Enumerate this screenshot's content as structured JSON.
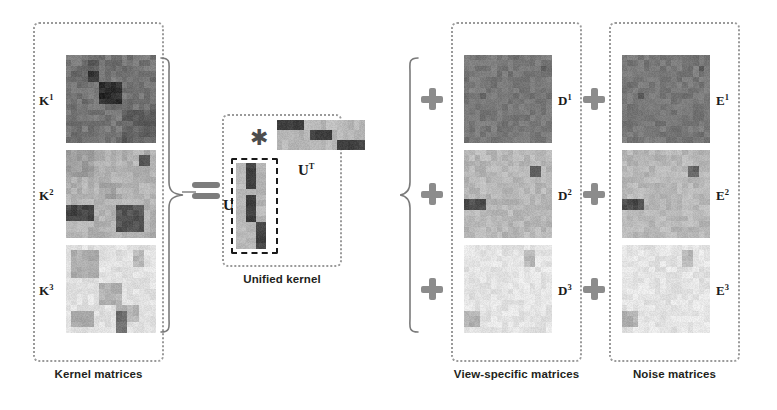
{
  "figure": {
    "background": "#ffffff"
  },
  "groups": [
    {
      "id": "kernel",
      "caption": "Kernel matrices",
      "x": 33,
      "y": 22,
      "w": 131,
      "h": 340
    },
    {
      "id": "unified",
      "caption": "Unified kernel",
      "x": 222,
      "y": 114,
      "w": 120,
      "h": 153
    },
    {
      "id": "view_specific",
      "caption": "View-specific matrices",
      "x": 451,
      "y": 22,
      "w": 131,
      "h": 340
    },
    {
      "id": "noise",
      "caption": "Noise matrices",
      "x": 609,
      "y": 22,
      "w": 131,
      "h": 340
    }
  ],
  "labels": {
    "k1": "K",
    "k1_sup": "1",
    "k2": "K",
    "k2_sup": "2",
    "k3": "K",
    "k3_sup": "3",
    "u": "U",
    "ut": "U",
    "ut_sup": "T",
    "d1": "D",
    "d1_sup": "1",
    "d2": "D",
    "d2_sup": "2",
    "d3": "D",
    "d3_sup": "3",
    "e1": "E",
    "e1_sup": "1",
    "e2": "E",
    "e2_sup": "2",
    "e3": "E",
    "e3_sup": "3",
    "asterisk": "✳",
    "equals_name": "equals-sign",
    "plus_name": "plus-sign"
  },
  "colors": {
    "box_border": "#9a9a9a",
    "operator": "#8c8c8c",
    "text": "#231f20",
    "brace": "#7a7a7a",
    "matrix_dark": "#3c3c3c",
    "matrix_mid": "#8f8f8f",
    "matrix_light": "#dcdcdc"
  },
  "chart_data": {
    "type": "heatmap",
    "note": "Each panel is a grayscale heatmap rendered on a 16x16 grid (U/U^T are 16x3 / 3x16).",
    "scale": {
      "min": 0,
      "max": 1,
      "colormap": "grayscale (0=dark, 1=light)"
    },
    "matrices": [
      {
        "name": "K1",
        "label": "K",
        "superscript": "1",
        "group": "kernel",
        "rows": 16,
        "cols": 16,
        "base": 0.46,
        "noise": 0.06,
        "blocks": [
          {
            "r": 0,
            "c": 0,
            "rh": 16,
            "cw": 16,
            "v": 0.46
          },
          {
            "r": 1,
            "c": 4,
            "rh": 2,
            "cw": 2,
            "v": 0.39
          },
          {
            "r": 2,
            "c": 2,
            "rh": 2,
            "cw": 2,
            "v": 0.41
          },
          {
            "r": 3,
            "c": 1,
            "rh": 2,
            "cw": 1,
            "v": 0.36
          },
          {
            "r": 3,
            "c": 4,
            "rh": 2,
            "cw": 2,
            "v": 0.22
          },
          {
            "r": 3,
            "c": 13,
            "rh": 1,
            "cw": 2,
            "v": 0.38
          },
          {
            "r": 5,
            "c": 6,
            "rh": 4,
            "cw": 4,
            "v": 0.17
          },
          {
            "r": 8,
            "c": 3,
            "rh": 1,
            "cw": 2,
            "v": 0.38
          },
          {
            "r": 10,
            "c": 10,
            "rh": 6,
            "cw": 6,
            "v": 0.38
          }
        ]
      },
      {
        "name": "K2",
        "label": "K",
        "superscript": "2",
        "group": "kernel",
        "rows": 16,
        "cols": 16,
        "base": 0.68,
        "noise": 0.05,
        "blocks": [
          {
            "r": 0,
            "c": 0,
            "rh": 16,
            "cw": 16,
            "v": 0.7
          },
          {
            "r": 0,
            "c": 0,
            "rh": 5,
            "cw": 5,
            "v": 0.62
          },
          {
            "r": 1,
            "c": 13,
            "rh": 2,
            "cw": 2,
            "v": 0.33
          },
          {
            "r": 6,
            "c": 6,
            "rh": 3,
            "cw": 3,
            "v": 0.64
          },
          {
            "r": 10,
            "c": 0,
            "rh": 3,
            "cw": 5,
            "v": 0.27
          },
          {
            "r": 10,
            "c": 9,
            "rh": 5,
            "cw": 5,
            "v": 0.33
          }
        ]
      },
      {
        "name": "K3",
        "label": "K",
        "superscript": "3",
        "group": "kernel",
        "rows": 16,
        "cols": 16,
        "base": 0.87,
        "noise": 0.04,
        "blocks": [
          {
            "r": 0,
            "c": 0,
            "rh": 16,
            "cw": 16,
            "v": 0.88
          },
          {
            "r": 1,
            "c": 1,
            "rh": 5,
            "cw": 5,
            "v": 0.68
          },
          {
            "r": 1,
            "c": 12,
            "rh": 3,
            "cw": 2,
            "v": 0.72
          },
          {
            "r": 7,
            "c": 6,
            "rh": 4,
            "cw": 4,
            "v": 0.7
          },
          {
            "r": 11,
            "c": 9,
            "rh": 3,
            "cw": 4,
            "v": 0.7
          },
          {
            "r": 12,
            "c": 1,
            "rh": 3,
            "cw": 4,
            "v": 0.66
          },
          {
            "r": 12,
            "c": 9,
            "rh": 4,
            "cw": 2,
            "v": 0.43
          }
        ]
      },
      {
        "name": "U",
        "label": "U",
        "superscript": "",
        "group": "unified",
        "rows": 16,
        "cols": 3,
        "base": 0.7,
        "noise": 0.04,
        "blocks": [
          {
            "r": 0,
            "c": 0,
            "rh": 16,
            "cw": 3,
            "v": 0.72
          },
          {
            "r": 0,
            "c": 1,
            "rh": 5,
            "cw": 1,
            "v": 0.26
          },
          {
            "r": 6,
            "c": 1,
            "rh": 5,
            "cw": 1,
            "v": 0.26
          },
          {
            "r": 11,
            "c": 2,
            "rh": 5,
            "cw": 1,
            "v": 0.26
          }
        ]
      },
      {
        "name": "UT",
        "label": "U",
        "superscript": "T",
        "group": "unified",
        "rows": 3,
        "cols": 16,
        "base": 0.7,
        "noise": 0.04,
        "blocks": [
          {
            "r": 0,
            "c": 0,
            "rh": 3,
            "cw": 16,
            "v": 0.72
          },
          {
            "r": 0,
            "c": 0,
            "rh": 1,
            "cw": 5,
            "v": 0.26
          },
          {
            "r": 1,
            "c": 6,
            "rh": 1,
            "cw": 4,
            "v": 0.26
          },
          {
            "r": 2,
            "c": 11,
            "rh": 1,
            "cw": 5,
            "v": 0.26
          }
        ]
      },
      {
        "name": "D1",
        "label": "D",
        "superscript": "1",
        "group": "view_specific",
        "rows": 16,
        "cols": 16,
        "base": 0.47,
        "noise": 0.05,
        "blocks": [
          {
            "r": 0,
            "c": 0,
            "rh": 16,
            "cw": 16,
            "v": 0.47
          },
          {
            "r": 2,
            "c": 14,
            "rh": 1,
            "cw": 1,
            "v": 0.36
          },
          {
            "r": 7,
            "c": 3,
            "rh": 1,
            "cw": 1,
            "v": 0.37
          }
        ]
      },
      {
        "name": "D2",
        "label": "D",
        "superscript": "2",
        "group": "view_specific",
        "rows": 16,
        "cols": 16,
        "base": 0.71,
        "noise": 0.05,
        "blocks": [
          {
            "r": 0,
            "c": 0,
            "rh": 16,
            "cw": 16,
            "v": 0.72
          },
          {
            "r": 3,
            "c": 12,
            "rh": 2,
            "cw": 2,
            "v": 0.41
          },
          {
            "r": 9,
            "c": 0,
            "rh": 2,
            "cw": 4,
            "v": 0.3
          }
        ]
      },
      {
        "name": "D3",
        "label": "D",
        "superscript": "3",
        "group": "view_specific",
        "rows": 16,
        "cols": 16,
        "base": 0.88,
        "noise": 0.04,
        "blocks": [
          {
            "r": 0,
            "c": 0,
            "rh": 16,
            "cw": 16,
            "v": 0.89
          },
          {
            "r": 1,
            "c": 11,
            "rh": 3,
            "cw": 2,
            "v": 0.72
          },
          {
            "r": 12,
            "c": 0,
            "rh": 3,
            "cw": 3,
            "v": 0.7
          }
        ]
      },
      {
        "name": "E1",
        "label": "E",
        "superscript": "1",
        "group": "noise",
        "rows": 16,
        "cols": 16,
        "base": 0.47,
        "noise": 0.05,
        "blocks": [
          {
            "r": 0,
            "c": 0,
            "rh": 16,
            "cw": 16,
            "v": 0.47
          },
          {
            "r": 2,
            "c": 14,
            "rh": 1,
            "cw": 1,
            "v": 0.36
          },
          {
            "r": 7,
            "c": 3,
            "rh": 1,
            "cw": 1,
            "v": 0.37
          }
        ]
      },
      {
        "name": "E2",
        "label": "E",
        "superscript": "2",
        "group": "noise",
        "rows": 16,
        "cols": 16,
        "base": 0.71,
        "noise": 0.05,
        "blocks": [
          {
            "r": 0,
            "c": 0,
            "rh": 16,
            "cw": 16,
            "v": 0.72
          },
          {
            "r": 3,
            "c": 12,
            "rh": 2,
            "cw": 2,
            "v": 0.41
          },
          {
            "r": 9,
            "c": 0,
            "rh": 2,
            "cw": 4,
            "v": 0.3
          }
        ]
      },
      {
        "name": "E3",
        "label": "E",
        "superscript": "3",
        "group": "noise",
        "rows": 16,
        "cols": 16,
        "base": 0.88,
        "noise": 0.04,
        "blocks": [
          {
            "r": 0,
            "c": 0,
            "rh": 16,
            "cw": 16,
            "v": 0.89
          },
          {
            "r": 1,
            "c": 11,
            "rh": 3,
            "cw": 2,
            "v": 0.72
          },
          {
            "r": 12,
            "c": 0,
            "rh": 3,
            "cw": 3,
            "v": 0.7
          }
        ]
      }
    ],
    "operators": [
      {
        "type": "brace-right",
        "between": [
          "kernel",
          "equals"
        ]
      },
      {
        "type": "equals",
        "between": [
          "kernel",
          "unified"
        ]
      },
      {
        "type": "asterisk",
        "between": [
          "U",
          "UT"
        ]
      },
      {
        "type": "brace-left",
        "before": "view_specific"
      },
      {
        "type": "plus",
        "count": 3,
        "before": "view_specific"
      },
      {
        "type": "plus",
        "count": 3,
        "before": "noise"
      }
    ]
  }
}
